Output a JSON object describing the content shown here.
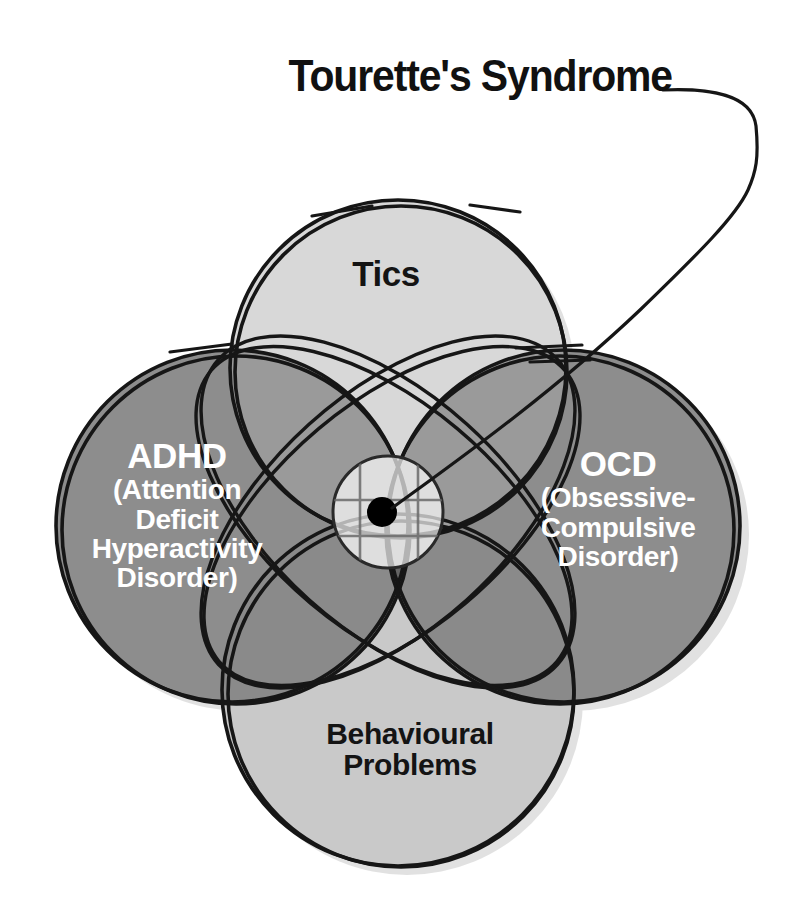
{
  "title": {
    "text": "Tourette's Syndrome",
    "leader_line": "curved-pointer-to-center"
  },
  "diagram": {
    "type": "venn",
    "set_count": 4,
    "intersection_marker": "black-dot",
    "intersection_label": "Tourette's Syndrome",
    "circles": [
      {
        "id": "tics",
        "label": "Tics",
        "lines": [
          "Tics"
        ],
        "position": "top",
        "fill": "#d6d6d6",
        "text_color": "#141414",
        "cx": 398,
        "cy": 368,
        "r": 168
      },
      {
        "id": "adhd",
        "label": "ADHD",
        "lines": [
          "ADHD",
          "(Attention",
          "Deficit",
          "Hyperactivity",
          "Disorder)"
        ],
        "position": "left",
        "fill": "#8d8d8d",
        "text_color": "#ffffff",
        "cx": 232,
        "cy": 526,
        "r": 176
      },
      {
        "id": "ocd",
        "label": "OCD",
        "lines": [
          "OCD",
          "(Obsessive-",
          "Compulsive",
          "Disorder)"
        ],
        "position": "right",
        "fill": "#8d8d8d",
        "text_color": "#ffffff",
        "cx": 564,
        "cy": 526,
        "r": 176
      },
      {
        "id": "behavioural-problems",
        "label": "Behavioural Problems",
        "lines": [
          "Behavioural",
          "Problems"
        ],
        "position": "bottom",
        "fill": "#c9c9c9",
        "text_color": "#141414",
        "cx": 398,
        "cy": 690,
        "r": 176
      }
    ],
    "center": {
      "x": 388,
      "y": 512,
      "dot_radius": 15,
      "halo_rx": 55,
      "halo_ry": 56
    },
    "colors": {
      "background": "#ffffff",
      "outline": "#141414",
      "light_fill": "#d6d6d6",
      "mid_fill": "#8d8d8d",
      "dark_overlap": "#6e6e6e",
      "darkest_overlap": "#5c5c5c",
      "center_fill": "#e2e2e2",
      "shadow": "#cfcfcf",
      "dot": "#000000",
      "title_color": "#111111"
    }
  }
}
